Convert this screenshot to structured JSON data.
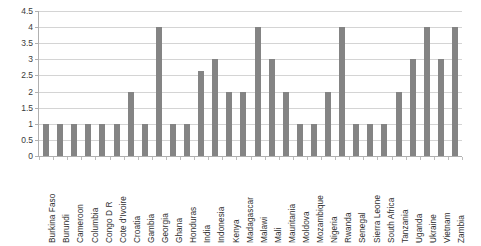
{
  "chart_data": {
    "type": "bar",
    "title": "",
    "subtitle": "",
    "xlabel": "",
    "ylabel": "",
    "ylim": [
      0,
      4.5
    ],
    "ytick_labels": [
      "4.5",
      "4",
      "3.5",
      "3",
      "2.5",
      "2",
      "1.5",
      "1",
      "0.5",
      "0"
    ],
    "ytick_values": [
      4.5,
      4,
      3.5,
      3,
      2.5,
      2,
      1.5,
      1,
      0.5,
      0
    ],
    "grid": "horizontal",
    "legend": "none",
    "bar_color": "#848484",
    "gridline_color": "#d4d4d4",
    "axis_color": "#b0b0b0",
    "categories": [
      "Burkina Faso",
      "Burundi",
      "Cameroon",
      "Columbia",
      "Congo D R",
      "Cote d'Ivoire",
      "Croatia",
      "Gambia",
      "Georgia",
      "Ghana",
      "Honduras",
      "India",
      "Indonesia",
      "Kenya",
      "Madagascar",
      "Malawi",
      "Mali",
      "Mauritania",
      "Moldova",
      "Mozambique",
      "Nigeria",
      "Rwanda",
      "Senegal",
      "Sierra Leone",
      "South Africa",
      "Tanzania",
      "Uganda",
      "Ukraine",
      "Vietnam",
      "Zambia"
    ],
    "values": [
      1,
      1,
      1,
      1,
      1,
      1,
      2,
      1,
      4,
      1,
      1,
      2.65,
      3,
      2,
      2,
      4,
      3,
      2,
      1,
      1,
      2,
      4,
      1,
      1,
      1,
      2,
      3,
      4,
      3,
      4
    ]
  }
}
